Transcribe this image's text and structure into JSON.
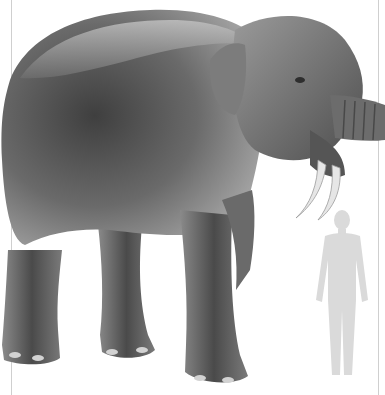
{
  "image": {
    "subject": "Deinotherium illustration with human scale silhouette",
    "style": "grayscale pencil drawing",
    "background_color": "#ffffff",
    "animal_color_dark": "#3d3d3d",
    "animal_color_mid": "#6e6e6e",
    "animal_color_light": "#b9b9b9",
    "tusk_color": "#e6e6e6",
    "human_silhouette_color": "#dadada",
    "frame_line_color": "#cfcfcf"
  }
}
